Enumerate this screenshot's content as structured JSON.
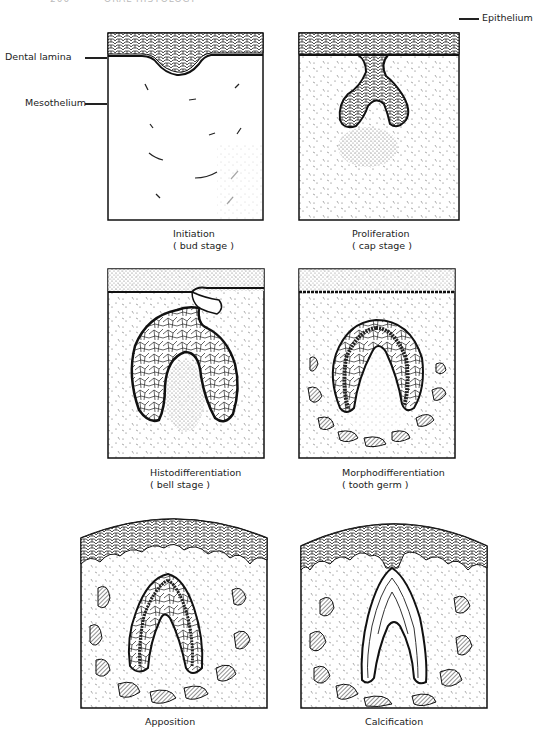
{
  "page": {
    "header_number": "200",
    "header_title": "ORAL HISTOLOGY"
  },
  "labels": {
    "dental_lamina": "Dental lamina",
    "mesothelium": "Mesothelium",
    "epithelium": "Epithelium"
  },
  "panels": [
    {
      "id": "initiation",
      "title": "Initiation",
      "subtitle": "( bud stage )"
    },
    {
      "id": "proliferation",
      "title": "Proliferation",
      "subtitle": "( cap stage )"
    },
    {
      "id": "histodifferentiation",
      "title": "Histodifferentiation",
      "subtitle": "( bell stage )"
    },
    {
      "id": "morphodifferentiation",
      "title": "Morphodifferentiation",
      "subtitle": "( tooth germ )"
    },
    {
      "id": "apposition",
      "title": "Apposition",
      "subtitle": ""
    },
    {
      "id": "calcification",
      "title": "Calcification",
      "subtitle": ""
    }
  ],
  "colors": {
    "ink": "#1a1a1a",
    "paper": "#ffffff"
  }
}
